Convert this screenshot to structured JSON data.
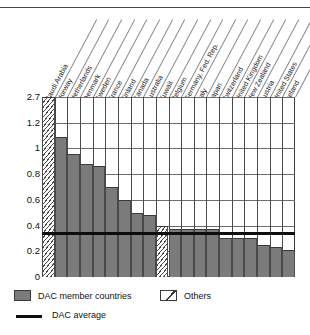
{
  "chart_data": {
    "type": "bar",
    "title": "",
    "subtitle": "",
    "xlabel": "",
    "ylabel": "",
    "grid": true,
    "legend_position": "bottom-left",
    "y_tick_labels": [
      "0",
      "0.2",
      "0.4",
      "0.6",
      "0.8",
      "1",
      "1.2",
      "2.7"
    ],
    "y_axis_note": "category-spaced (equal pixel spacing per tick); top band 1.2 to 2.7 compressed",
    "categories": [
      "Saudi Arabia",
      "Norway",
      "Netherlands",
      "Denmark",
      "Sweden",
      "France",
      "Finland",
      "Canada",
      "Australia",
      "Kuwait",
      "Belgium",
      "Germany, Fed. Rep.",
      "Italy",
      "Japan",
      "Switzerland",
      "United Kingdom",
      "New Zealand",
      "Austria",
      "United States",
      "Ireland"
    ],
    "values": [
      2.7,
      1.09,
      0.96,
      0.88,
      0.86,
      0.7,
      0.6,
      0.5,
      0.48,
      0.4,
      0.37,
      0.37,
      0.37,
      0.37,
      0.3,
      0.3,
      0.3,
      0.25,
      0.23,
      0.21
    ],
    "groups": [
      "Others",
      "DAC member countries",
      "DAC member countries",
      "DAC member countries",
      "DAC member countries",
      "DAC member countries",
      "DAC member countries",
      "DAC member countries",
      "DAC member countries",
      "Others",
      "DAC member countries",
      "DAC member countries",
      "DAC member countries",
      "DAC member countries",
      "DAC member countries",
      "DAC member countries",
      "DAC member countries",
      "DAC member countries",
      "DAC member countries",
      "DAC member countries"
    ],
    "reference_line": {
      "label": "DAC average",
      "value": 0.35
    },
    "series": [
      {
        "name": "Official development assistance as share of GNP",
        "values": [
          2.7,
          1.09,
          0.96,
          0.88,
          0.86,
          0.7,
          0.6,
          0.5,
          0.48,
          0.4,
          0.37,
          0.37,
          0.37,
          0.37,
          0.3,
          0.3,
          0.3,
          0.25,
          0.23,
          0.21
        ]
      }
    ]
  },
  "legend": {
    "dac_label": "DAC member countries",
    "others_label": "Others",
    "average_label": "DAC average"
  },
  "colors": {
    "dac_fill": "#7b7b7b",
    "grid": "#6d6d6d",
    "frame": "#3a3a3a",
    "average_line": "#0d0d0d"
  }
}
